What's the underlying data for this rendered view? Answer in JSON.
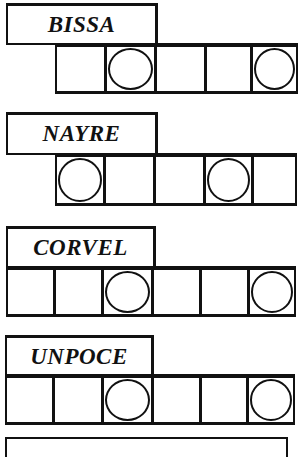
{
  "puzzles": [
    {
      "scrambled_word": "BISSA",
      "label": {
        "x": 6,
        "y": 3,
        "w": 152,
        "h": 42
      },
      "cells": {
        "x": 55,
        "y": 43,
        "h": 51,
        "widths": [
          50,
          50,
          50,
          46,
          47
        ]
      },
      "circled": [
        false,
        true,
        false,
        false,
        true
      ]
    },
    {
      "scrambled_word": "NAYRE",
      "label": {
        "x": 6,
        "y": 112,
        "w": 152,
        "h": 43
      },
      "cells": {
        "x": 55,
        "y": 153,
        "h": 53,
        "widths": [
          49,
          50,
          50,
          48,
          45
        ]
      },
      "circled": [
        true,
        false,
        false,
        true,
        false
      ]
    },
    {
      "scrambled_word": "CORVEL",
      "label": {
        "x": 6,
        "y": 226,
        "w": 150,
        "h": 43
      },
      "cells": {
        "x": 6,
        "y": 266,
        "h": 51,
        "widths": [
          48,
          48,
          50,
          48,
          48,
          48
        ]
      },
      "circled": [
        false,
        false,
        true,
        false,
        false,
        true
      ]
    },
    {
      "scrambled_word": "UNPOCE",
      "label": {
        "x": 5,
        "y": 335,
        "w": 149,
        "h": 42
      },
      "cells": {
        "x": 5,
        "y": 374,
        "h": 51,
        "widths": [
          48,
          49,
          50,
          48,
          47,
          48
        ]
      },
      "circled": [
        false,
        false,
        true,
        false,
        false,
        true
      ]
    }
  ],
  "answer_box": {
    "visible": true
  }
}
